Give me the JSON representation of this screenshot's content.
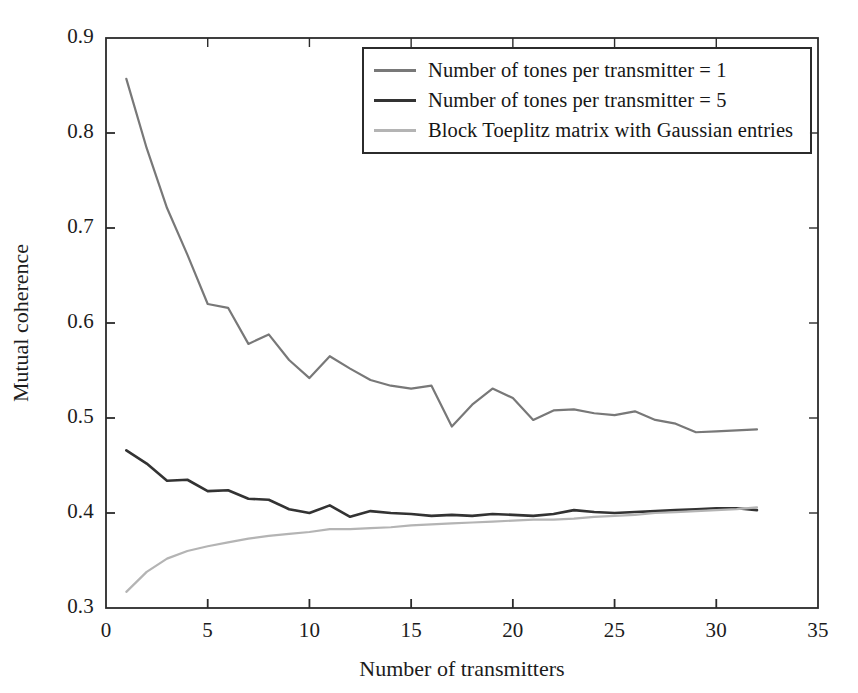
{
  "chart_data": {
    "type": "line",
    "title": "",
    "xlabel": "Number of transmitters",
    "ylabel": "Mutual coherence",
    "xlim": [
      0,
      35
    ],
    "ylim": [
      0.3,
      0.9
    ],
    "xticks": [
      0,
      5,
      10,
      15,
      20,
      25,
      30,
      35
    ],
    "xtick_labels": [
      "0",
      "5",
      "10",
      "15",
      "20",
      "25",
      "30",
      "35"
    ],
    "yticks": [
      0.3,
      0.4,
      0.5,
      0.6,
      0.7,
      0.8,
      0.9
    ],
    "ytick_labels": [
      "0.3",
      "0.4",
      "0.5",
      "0.6",
      "0.7",
      "0.8",
      "0.9"
    ],
    "grid": false,
    "legend_position": "top-right",
    "x": [
      1,
      2,
      3,
      4,
      5,
      6,
      7,
      8,
      9,
      10,
      11,
      12,
      13,
      14,
      15,
      16,
      17,
      18,
      19,
      20,
      21,
      22,
      23,
      24,
      25,
      26,
      27,
      28,
      29,
      30,
      31,
      32
    ],
    "series": [
      {
        "name": "Number of tones per transmitter = 1",
        "color": "#787878",
        "width": 2.2,
        "values": [
          0.857,
          0.784,
          0.721,
          0.672,
          0.62,
          0.616,
          0.578,
          0.588,
          0.561,
          0.542,
          0.565,
          0.552,
          0.54,
          0.534,
          0.531,
          0.534,
          0.491,
          0.514,
          0.531,
          0.521,
          0.498,
          0.508,
          0.509,
          0.505,
          0.503,
          0.507,
          0.498,
          0.494,
          0.485,
          0.486,
          0.487,
          0.488
        ]
      },
      {
        "name": "Number of tones per transmitter = 5",
        "color": "#333333",
        "width": 2.6,
        "values": [
          0.466,
          0.452,
          0.434,
          0.435,
          0.423,
          0.424,
          0.415,
          0.414,
          0.404,
          0.4,
          0.408,
          0.396,
          0.402,
          0.4,
          0.399,
          0.397,
          0.398,
          0.397,
          0.399,
          0.398,
          0.397,
          0.399,
          0.403,
          0.401,
          0.4,
          0.401,
          0.402,
          0.403,
          0.404,
          0.405,
          0.405,
          0.403
        ]
      },
      {
        "name": "Block Toeplitz matrix with Gaussian entries",
        "color": "#b4b4b4",
        "width": 2.2,
        "values": [
          0.317,
          0.338,
          0.352,
          0.36,
          0.365,
          0.369,
          0.373,
          0.376,
          0.378,
          0.38,
          0.383,
          0.383,
          0.384,
          0.385,
          0.387,
          0.388,
          0.389,
          0.39,
          0.391,
          0.392,
          0.393,
          0.393,
          0.394,
          0.396,
          0.397,
          0.398,
          0.4,
          0.401,
          0.402,
          0.403,
          0.404,
          0.406
        ]
      }
    ]
  },
  "legend": {
    "items": [
      {
        "label": "Number of tones per transmitter = 1",
        "color": "#787878"
      },
      {
        "label": "Number of tones per transmitter = 5",
        "color": "#333333"
      },
      {
        "label": "Block Toeplitz matrix with Gaussian entries",
        "color": "#b4b4b4"
      }
    ]
  },
  "axes": {
    "x_title": "Number of transmitters",
    "y_title": "Mutual coherence"
  }
}
